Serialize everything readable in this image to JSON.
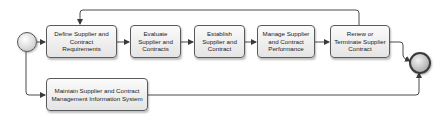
{
  "diagram": {
    "type": "process-flow",
    "start_event": {
      "label": "",
      "icon": "start-event-circle"
    },
    "end_event": {
      "label": "",
      "icon": "end-event-circle"
    },
    "tasks": [
      {
        "id": "define",
        "label": "Define Supplier and Contract Requirements"
      },
      {
        "id": "evaluate",
        "label": "Evaluate Supplier and Contracts"
      },
      {
        "id": "establish",
        "label": "Establish Supplier and Contract"
      },
      {
        "id": "manage",
        "label": "Manage Supplier and Contract Performance"
      },
      {
        "id": "renew",
        "label": "Renew or Terminate Supplier Contract"
      },
      {
        "id": "maintain",
        "label": "Maintain Supplier and Contract Management Information System"
      }
    ],
    "flows": [
      {
        "from": "start",
        "to": "define"
      },
      {
        "from": "start",
        "to": "maintain"
      },
      {
        "from": "define",
        "to": "evaluate"
      },
      {
        "from": "evaluate",
        "to": "establish"
      },
      {
        "from": "establish",
        "to": "manage"
      },
      {
        "from": "manage",
        "to": "renew"
      },
      {
        "from": "renew",
        "to": "define",
        "note": "loop back"
      },
      {
        "from": "renew",
        "to": "end"
      },
      {
        "from": "maintain",
        "to": "end"
      }
    ],
    "colors": {
      "line": "#4a4a4a",
      "box_border": "#5a5a5a",
      "box_fill": "#eeeeee"
    }
  }
}
